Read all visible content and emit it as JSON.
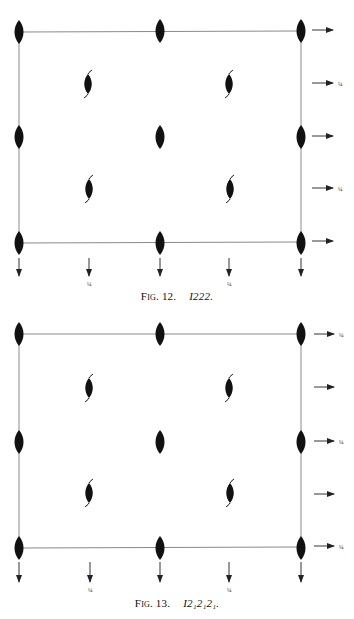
{
  "figures": [
    {
      "id": "fig12",
      "caption_label": "Fig. 12.",
      "caption_symbol": "I",
      "caption_symbol_rest": "222.",
      "space_group": "I222",
      "box": {
        "left": 19,
        "right": 301,
        "top": 32,
        "bottom": 242
      },
      "right_arrow_labels": [
        "",
        "¼",
        "",
        "¼",
        ""
      ],
      "bottom_arrow_labels": [
        "",
        "¼",
        "",
        "¼",
        ""
      ]
    },
    {
      "id": "fig13",
      "caption_label": "Fig. 13.",
      "caption_symbol": "I",
      "caption_symbol_rest": "2₁2₁2₁.",
      "space_group": "I2₁2₁2₁",
      "box": {
        "left": 19,
        "right": 301,
        "top": 334,
        "bottom": 548
      },
      "right_arrow_labels": [
        "¼",
        "",
        "¼",
        "",
        "¼"
      ],
      "bottom_arrow_labels": [
        "",
        "¼",
        "",
        "¼",
        ""
      ]
    }
  ],
  "legend": {
    "twofold_axis_symbol": "filled-lens",
    "twofold_screw_symbol": "lens-with-tails",
    "horizontal_axis_arrow": "arrow"
  },
  "colors": {
    "ink": "#111111",
    "line": "#888888",
    "paper": "#ffffff"
  }
}
